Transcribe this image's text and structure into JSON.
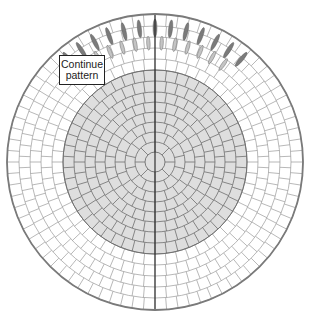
{
  "diagram": {
    "callout": {
      "line1": "Continue",
      "line2": "pattern"
    },
    "geometry": {
      "cx": 155,
      "cy": 162,
      "outer_radius": 148,
      "gray_radius": 92,
      "center_radius": 10
    },
    "colors": {
      "background": "#ffffff",
      "outer_fill": "#ffffff",
      "inner_fill": "#dedede",
      "joint_line": "#9a9a9a",
      "inner_joint_line": "#6e6e6e",
      "outer_edge": "#7a7a7a",
      "centerline": "#222222",
      "dark_stone": "#7b7b7b",
      "light_stone": "#c4c4c4"
    },
    "inner_rings": [
      {
        "r0": 10,
        "r1": 20,
        "count": 8
      },
      {
        "r0": 20,
        "r1": 30,
        "count": 14
      },
      {
        "r0": 30,
        "r1": 40,
        "count": 20
      },
      {
        "r0": 40,
        "r1": 50,
        "count": 26
      },
      {
        "r0": 50,
        "r1": 60,
        "count": 32
      },
      {
        "r0": 60,
        "r1": 70,
        "count": 38
      },
      {
        "r0": 70,
        "r1": 81,
        "count": 44
      },
      {
        "r0": 81,
        "r1": 92,
        "count": 50
      }
    ],
    "outer_rings": [
      {
        "r0": 92,
        "r1": 103,
        "count": 56
      },
      {
        "r0": 103,
        "r1": 114,
        "count": 62
      },
      {
        "r0": 114,
        "r1": 125,
        "count": 68
      },
      {
        "r0": 125,
        "r1": 136,
        "count": 74
      },
      {
        "r0": 136,
        "r1": 148,
        "count": 80
      }
    ],
    "fan_stones": {
      "dark": {
        "radius": 134,
        "start_deg": -130,
        "end_deg": -50,
        "count": 13,
        "length": 18,
        "width": 4
      },
      "light": {
        "radius": 119,
        "start_deg": -125,
        "end_deg": -55,
        "count": 12,
        "length": 14,
        "width": 3.5
      }
    }
  }
}
